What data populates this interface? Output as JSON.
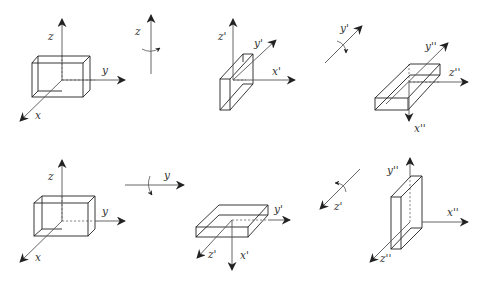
{
  "figure": {
    "rows": [
      {
        "frames": [
          {
            "name": "frame-original",
            "axes": {
              "z": "z",
              "y": "y",
              "x": "x"
            }
          },
          {
            "name": "rotation-about-z",
            "axis_label": "z"
          },
          {
            "name": "frame-primed",
            "axes": {
              "z": "z'",
              "y": "y'",
              "x": "x'"
            }
          },
          {
            "name": "rotation-about-y-prime",
            "axis_label": "y'"
          },
          {
            "name": "frame-double-primed",
            "axes": {
              "z": "z''",
              "y": "y''",
              "x": "x''"
            }
          }
        ]
      },
      {
        "frames": [
          {
            "name": "frame-original",
            "axes": {
              "z": "z",
              "y": "y",
              "x": "x"
            }
          },
          {
            "name": "rotation-about-y",
            "axis_label": "y"
          },
          {
            "name": "frame-primed",
            "axes": {
              "z": "z'",
              "y": "y'",
              "x": "x'"
            }
          },
          {
            "name": "rotation-about-z-prime",
            "axis_label": "z'"
          },
          {
            "name": "frame-double-primed",
            "axes": {
              "z": "z''",
              "y": "y''",
              "x": "x''"
            }
          }
        ]
      }
    ]
  },
  "labels": {
    "r1b1_z": "z",
    "r1b1_y": "y",
    "r1b1_x": "x",
    "r1rot": "z",
    "r1b2_z": "z'",
    "r1b2_y": "y'",
    "r1b2_x": "x'",
    "r1rot2": "y'",
    "r1b3_y": "y''",
    "r1b3_z": "z''",
    "r1b3_x": "x''",
    "r2b1_z": "z",
    "r2b1_y": "y",
    "r2b1_x": "x",
    "r2rot": "y",
    "r2b2_y": "y'",
    "r2b2_z": "z'",
    "r2b2_x": "x'",
    "r2rot2": "z'",
    "r2b3_y": "y''",
    "r2b3_x": "x''",
    "r2b3_z": "z''"
  },
  "colors": {
    "background": "#ffffff",
    "line": "#222222",
    "axis": "#555555",
    "text": "#333333"
  }
}
